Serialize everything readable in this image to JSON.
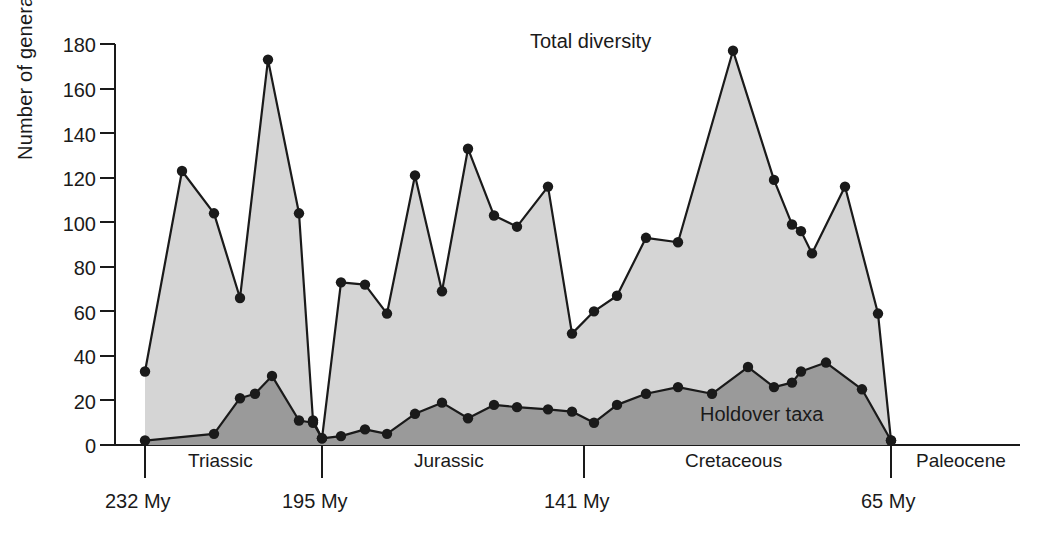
{
  "chart_data": {
    "type": "area",
    "title": "",
    "xlabel": "",
    "ylabel": "Number of genera",
    "ylim": [
      0,
      180
    ],
    "ytick_step": 20,
    "yticks": [
      "0",
      "20",
      "40",
      "60",
      "80",
      "100",
      "120",
      "140",
      "160",
      "180"
    ],
    "grid": false,
    "legend_position": "in-plot annotations",
    "x_axis_kind": "geologic time (My before present, older at left)",
    "x_range_my": [
      232,
      57
    ],
    "axis_boundaries_my": [
      232,
      195,
      141,
      65
    ],
    "boundary_tick_labels": [
      "232 My",
      "195 My",
      "141 My",
      "65 My"
    ],
    "period_labels": [
      "Triassic",
      "Jurassic",
      "Cretaceous",
      "Paleocene"
    ],
    "annotations": [
      {
        "text": "Total diversity",
        "series": "total-diversity"
      },
      {
        "text": "Holdover taxa",
        "series": "holdover-taxa"
      }
    ],
    "series": [
      {
        "name": "Total diversity",
        "fill_color": "#d5d5d5",
        "line_color": "#1a1a1a",
        "marker": "filled-circle",
        "x_my": [
          232,
          226,
          220,
          214,
          208,
          202,
          197,
          195,
          192,
          187,
          182,
          177,
          172,
          167,
          162,
          157,
          152,
          147,
          141,
          136,
          131,
          126,
          121,
          116,
          111,
          106,
          101,
          96,
          91,
          86,
          81,
          76,
          71,
          65,
          57
        ],
        "values": [
          33,
          123,
          104,
          66,
          173,
          104,
          11,
          3,
          73,
          72,
          59,
          121,
          69,
          133,
          103,
          98,
          116,
          50,
          60,
          67,
          93,
          91,
          177,
          119,
          99,
          96,
          86,
          116,
          59,
          2,
          2,
          2,
          2,
          2,
          2
        ]
      },
      {
        "name": "Holdover taxa",
        "fill_color": "#9a9a9a",
        "line_color": "#1a1a1a",
        "marker": "filled-circle",
        "x_my": [
          232,
          226,
          220,
          214,
          208,
          202,
          197,
          195,
          192,
          187,
          182,
          177,
          172,
          167,
          162,
          157,
          152,
          147,
          141,
          136,
          131,
          126,
          121,
          116,
          111,
          106,
          101,
          96,
          91,
          86,
          81,
          76,
          71,
          65,
          57
        ],
        "values": [
          2,
          2,
          5,
          21,
          23,
          31,
          11,
          3,
          4,
          7,
          5,
          14,
          19,
          12,
          18,
          17,
          16,
          15,
          10,
          18,
          23,
          26,
          23,
          35,
          28,
          26,
          33,
          37,
          32,
          25,
          2,
          2,
          2,
          2,
          2
        ]
      }
    ],
    "plot_points_total": [
      {
        "x_px": 145,
        "value": 33
      },
      {
        "x_px": 182,
        "value": 123
      },
      {
        "x_px": 214,
        "value": 104
      },
      {
        "x_px": 240,
        "value": 66
      },
      {
        "x_px": 268,
        "value": 173
      },
      {
        "x_px": 299,
        "value": 104
      },
      {
        "x_px": 313,
        "value": 11
      },
      {
        "x_px": 322,
        "value": 3
      },
      {
        "x_px": 341,
        "value": 73
      },
      {
        "x_px": 365,
        "value": 72
      },
      {
        "x_px": 387,
        "value": 59
      },
      {
        "x_px": 415,
        "value": 121
      },
      {
        "x_px": 442,
        "value": 69
      },
      {
        "x_px": 468,
        "value": 133
      },
      {
        "x_px": 494,
        "value": 103
      },
      {
        "x_px": 517,
        "value": 98
      },
      {
        "x_px": 548,
        "value": 116
      },
      {
        "x_px": 572,
        "value": 50
      },
      {
        "x_px": 594,
        "value": 60
      },
      {
        "x_px": 617,
        "value": 67
      },
      {
        "x_px": 646,
        "value": 93
      },
      {
        "x_px": 678,
        "value": 91
      },
      {
        "x_px": 733,
        "value": 177
      },
      {
        "x_px": 774,
        "value": 119
      },
      {
        "x_px": 792,
        "value": 99
      },
      {
        "x_px": 801,
        "value": 96
      },
      {
        "x_px": 812,
        "value": 86
      },
      {
        "x_px": 845,
        "value": 116
      },
      {
        "x_px": 878,
        "value": 59
      },
      {
        "x_px": 891,
        "value": 2
      }
    ],
    "plot_points_holdover": [
      {
        "x_px": 145,
        "value": 2
      },
      {
        "x_px": 214,
        "value": 5
      },
      {
        "x_px": 240,
        "value": 21
      },
      {
        "x_px": 255,
        "value": 23
      },
      {
        "x_px": 272,
        "value": 31
      },
      {
        "x_px": 299,
        "value": 11
      },
      {
        "x_px": 313,
        "value": 10
      },
      {
        "x_px": 322,
        "value": 3
      },
      {
        "x_px": 341,
        "value": 4
      },
      {
        "x_px": 365,
        "value": 7
      },
      {
        "x_px": 387,
        "value": 5
      },
      {
        "x_px": 415,
        "value": 14
      },
      {
        "x_px": 442,
        "value": 19
      },
      {
        "x_px": 468,
        "value": 12
      },
      {
        "x_px": 494,
        "value": 18
      },
      {
        "x_px": 517,
        "value": 17
      },
      {
        "x_px": 548,
        "value": 16
      },
      {
        "x_px": 572,
        "value": 15
      },
      {
        "x_px": 594,
        "value": 10
      },
      {
        "x_px": 617,
        "value": 18
      },
      {
        "x_px": 646,
        "value": 23
      },
      {
        "x_px": 678,
        "value": 26
      },
      {
        "x_px": 712,
        "value": 23
      },
      {
        "x_px": 748,
        "value": 35
      },
      {
        "x_px": 774,
        "value": 26
      },
      {
        "x_px": 792,
        "value": 28
      },
      {
        "x_px": 801,
        "value": 33
      },
      {
        "x_px": 826,
        "value": 37
      },
      {
        "x_px": 862,
        "value": 25
      },
      {
        "x_px": 891,
        "value": 2
      }
    ]
  },
  "figure": {
    "ylabel": "Number of genera",
    "yticks": [
      "180",
      "160",
      "140",
      "120",
      "100",
      "80",
      "60",
      "40",
      "20",
      "0"
    ],
    "periods": [
      {
        "label": "Triassic"
      },
      {
        "label": "Jurassic"
      },
      {
        "label": "Cretaceous"
      },
      {
        "label": "Paleocene"
      }
    ],
    "ages": [
      {
        "label": "232 My"
      },
      {
        "label": "195 My"
      },
      {
        "label": "141 My"
      },
      {
        "label": "65 My"
      }
    ],
    "series_labels": [
      {
        "label": "Total diversity"
      },
      {
        "label": "Holdover taxa"
      }
    ],
    "colors": {
      "total_fill": "#d5d5d5",
      "holdover_fill": "#9a9a9a",
      "line": "#1a1a1a",
      "background": "#ffffff"
    }
  }
}
